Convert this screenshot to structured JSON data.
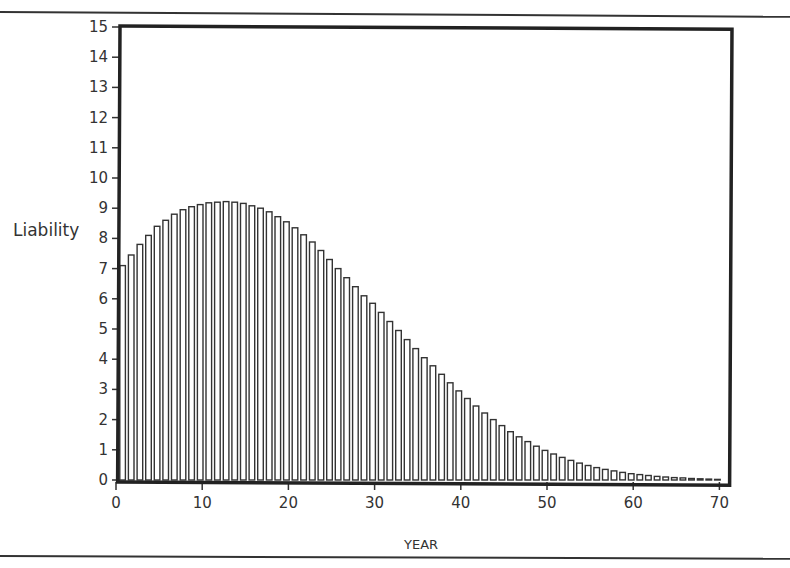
{
  "chart_data": {
    "type": "bar",
    "title": "",
    "xlabel": "YEAR",
    "ylabel": "Liability",
    "xlim": [
      0,
      70
    ],
    "ylim": [
      0,
      15
    ],
    "x_ticks": [
      0,
      10,
      20,
      30,
      40,
      50,
      60,
      70
    ],
    "y_ticks": [
      0,
      1,
      2,
      3,
      4,
      5,
      6,
      7,
      8,
      9,
      10,
      11,
      12,
      13,
      14,
      15
    ],
    "grid": false,
    "legend": null,
    "bar_style": "outlined",
    "x": [
      1,
      2,
      3,
      4,
      5,
      6,
      7,
      8,
      9,
      10,
      11,
      12,
      13,
      14,
      15,
      16,
      17,
      18,
      19,
      20,
      21,
      22,
      23,
      24,
      25,
      26,
      27,
      28,
      29,
      30,
      31,
      32,
      33,
      34,
      35,
      36,
      37,
      38,
      39,
      40,
      41,
      42,
      43,
      44,
      45,
      46,
      47,
      48,
      49,
      50,
      51,
      52,
      53,
      54,
      55,
      56,
      57,
      58,
      59,
      60,
      61,
      62,
      63,
      64,
      65,
      66,
      67,
      68,
      69,
      70
    ],
    "values": [
      7.1,
      7.45,
      7.8,
      8.1,
      8.4,
      8.6,
      8.8,
      8.95,
      9.05,
      9.12,
      9.18,
      9.2,
      9.22,
      9.2,
      9.16,
      9.08,
      9.0,
      8.88,
      8.72,
      8.55,
      8.35,
      8.12,
      7.88,
      7.6,
      7.3,
      7.0,
      6.7,
      6.4,
      6.1,
      5.85,
      5.55,
      5.25,
      4.95,
      4.65,
      4.35,
      4.05,
      3.78,
      3.5,
      3.22,
      2.95,
      2.7,
      2.45,
      2.22,
      2.0,
      1.8,
      1.6,
      1.43,
      1.27,
      1.12,
      0.98,
      0.86,
      0.75,
      0.65,
      0.56,
      0.48,
      0.41,
      0.35,
      0.3,
      0.25,
      0.21,
      0.18,
      0.15,
      0.12,
      0.1,
      0.08,
      0.07,
      0.05,
      0.04,
      0.03,
      0.02
    ]
  }
}
